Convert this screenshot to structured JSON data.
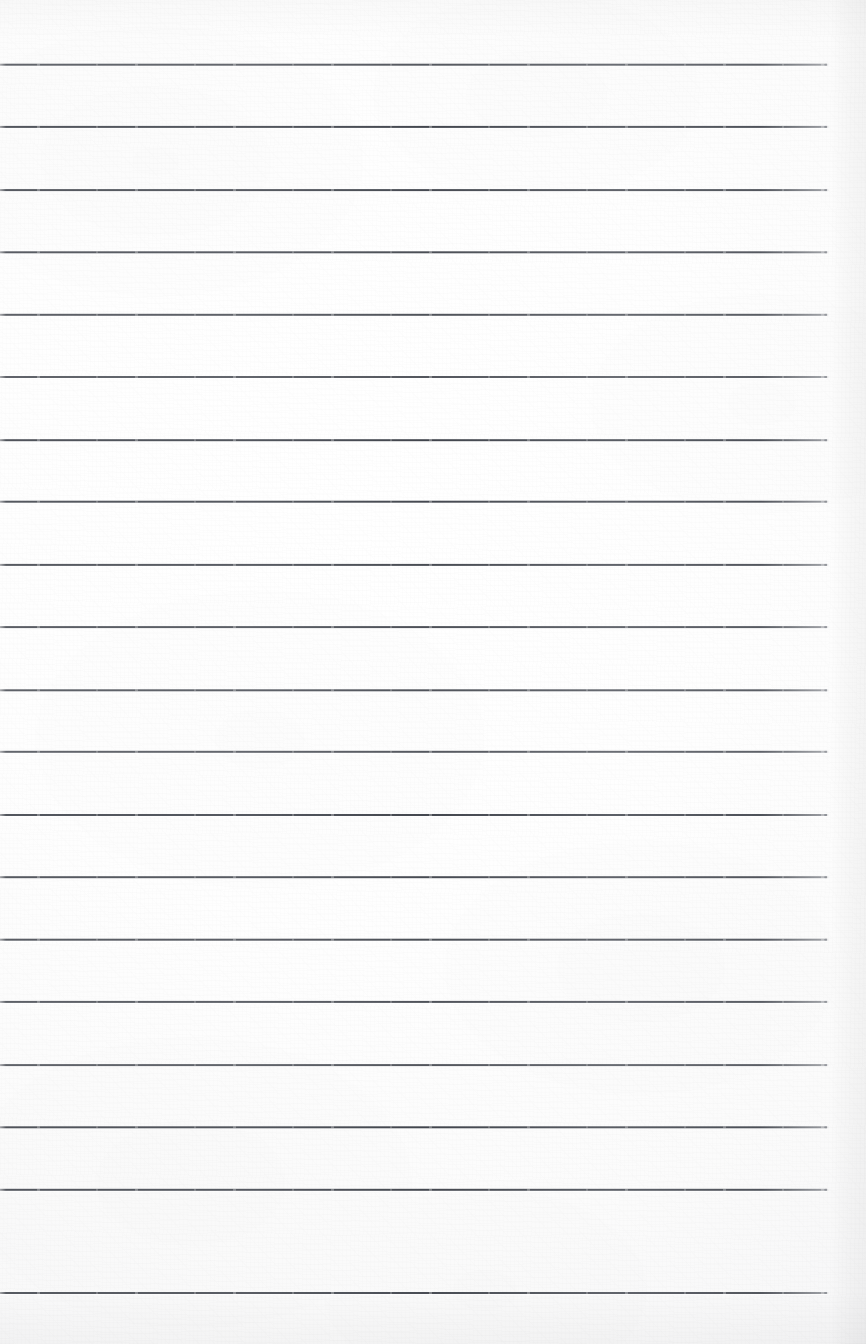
{
  "document": {
    "kind": "lined-notebook-paper-scan",
    "title": "Blank Lined Notebook Page",
    "written_content": "",
    "page_text": "",
    "notes": []
  },
  "canvas": {
    "width": 866,
    "height": 1344,
    "background_color": "#fdfdfd",
    "paper_color": "#ffffff",
    "edge_shadow_color": "#f1f1f3"
  },
  "ruling": {
    "line_color": "#3e424a",
    "line_thickness_px": 2,
    "line_count": 20,
    "first_line_y": 64,
    "line_spacing_px": 62.5,
    "line_start_x": 0,
    "line_end_x": 827,
    "line_length_px": 827,
    "top_margin_px": 64,
    "bottom_margin_px": 52,
    "line_positions_y": [
      64,
      126,
      189,
      251,
      314,
      376,
      439,
      501,
      564,
      626,
      689,
      751,
      814,
      876,
      939,
      1001,
      1064,
      1126,
      1189,
      1292
    ]
  },
  "right_margin": {
    "start_x": 830,
    "width_px": 36,
    "tint_color": "#f0f0f2"
  }
}
